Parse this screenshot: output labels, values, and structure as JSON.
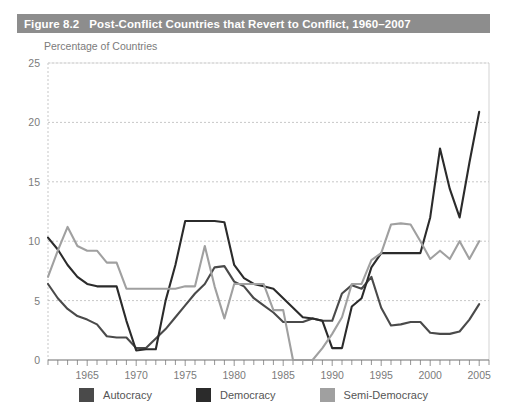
{
  "figure": {
    "number": "Figure 8.2",
    "title": "Post-Conflict Countries that Revert to Conflict, 1960–2007",
    "axis_title": "Percentage of Countries"
  },
  "legend": {
    "items": [
      {
        "label": "Autocracy",
        "color": "#4a4a4a"
      },
      {
        "label": "Democracy",
        "color": "#2b2b2b"
      },
      {
        "label": "Semi-Democracy",
        "color": "#a0a0a0"
      }
    ]
  },
  "colors": {
    "title_bar": "#8d8d8d",
    "title_text": "#ffffff",
    "axis_text": "#7b7b7b",
    "grid": "#b9b9b9",
    "frame": "#8d8d8d",
    "autocracy": "#4a4a4a",
    "democracy": "#2b2b2b",
    "semi_democracy": "#a0a0a0",
    "background": "#ffffff"
  },
  "chart_data": {
    "type": "line",
    "title": "Post-Conflict Countries that Revert to Conflict, 1960–2007",
    "xlabel": "",
    "ylabel": "Percentage of Countries",
    "xlim": [
      1961,
      2006
    ],
    "ylim": [
      0,
      25
    ],
    "yticks": [
      0,
      5,
      10,
      15,
      20,
      25
    ],
    "xticks_major": [
      1965,
      1970,
      1975,
      1980,
      1985,
      1990,
      1995,
      2000,
      2005
    ],
    "xticks_minor_step": 1,
    "grid": "horizontal-dashed",
    "legend_position": "below",
    "x": [
      1961,
      1962,
      1963,
      1964,
      1965,
      1966,
      1967,
      1968,
      1969,
      1970,
      1971,
      1972,
      1973,
      1974,
      1975,
      1976,
      1977,
      1978,
      1979,
      1980,
      1981,
      1982,
      1983,
      1984,
      1985,
      1986,
      1987,
      1988,
      1989,
      1990,
      1991,
      1992,
      1993,
      1994,
      1995,
      1996,
      1997,
      1998,
      1999,
      2000,
      2001,
      2002,
      2003,
      2004,
      2005
    ],
    "series": [
      {
        "name": "Autocracy",
        "color": "#4a4a4a",
        "values": [
          6.4,
          5.2,
          4.3,
          3.7,
          3.4,
          3.0,
          2.0,
          1.9,
          1.9,
          1.0,
          1.0,
          1.8,
          2.6,
          3.6,
          4.6,
          5.6,
          6.4,
          7.8,
          7.9,
          6.6,
          6.2,
          5.2,
          4.6,
          4.0,
          3.2,
          3.2,
          3.2,
          3.5,
          3.3,
          3.3,
          5.6,
          6.3,
          6.0,
          7.0,
          4.4,
          2.9,
          3.0,
          3.2,
          3.2,
          2.3,
          2.2,
          2.2,
          2.4,
          3.4,
          4.7
        ]
      },
      {
        "name": "Democracy",
        "color": "#2b2b2b",
        "values": [
          10.3,
          9.3,
          8.0,
          7.0,
          6.4,
          6.2,
          6.2,
          6.2,
          3.3,
          0.8,
          0.9,
          0.9,
          5.0,
          8.0,
          11.7,
          11.7,
          11.7,
          11.7,
          11.6,
          8.0,
          6.9,
          6.4,
          6.2,
          6.0,
          5.2,
          4.4,
          3.6,
          3.5,
          3.3,
          1.0,
          1.0,
          4.5,
          5.2,
          7.8,
          9.0,
          9.0,
          9.0,
          9.0,
          9.0,
          12.0,
          17.8,
          14.4,
          12.0,
          16.6,
          20.9
        ]
      },
      {
        "name": "Semi-Democracy",
        "color": "#a0a0a0",
        "values": [
          7.0,
          9.2,
          11.2,
          9.6,
          9.2,
          9.2,
          8.2,
          8.2,
          6.0,
          6.0,
          6.0,
          6.0,
          6.0,
          6.0,
          6.2,
          6.2,
          9.6,
          6.2,
          3.5,
          6.4,
          6.4,
          6.4,
          6.4,
          4.2,
          4.2,
          0.0,
          0.0,
          0.0,
          1.0,
          2.2,
          3.6,
          6.4,
          6.4,
          8.4,
          9.0,
          11.4,
          11.5,
          11.4,
          10.0,
          8.5,
          9.2,
          8.5,
          10.0,
          8.5,
          10.0
        ]
      }
    ]
  }
}
